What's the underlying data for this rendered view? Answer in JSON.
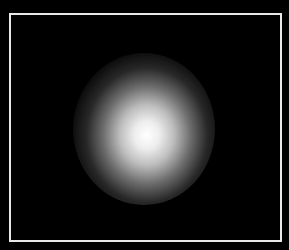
{
  "image": {
    "description": "Blurred bright white circular glow on black background inside a thin white rectangular frame",
    "colors": {
      "background": "#000000",
      "frame_border": "#e8e8e8",
      "glow_core": "#ffffff"
    }
  }
}
